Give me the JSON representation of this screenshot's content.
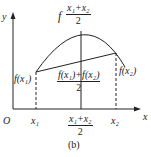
{
  "figure": {
    "caption": "(b)",
    "axes": {
      "x_label": "x",
      "y_label": "y",
      "origin_label": "O"
    },
    "x_ticks": {
      "x1": "x₁",
      "x2": "x₂",
      "mid_num": "x₁+x₂",
      "mid_den": "2"
    },
    "points": {
      "f_x1": "f(x₁)",
      "f_x2": "f(x₂)",
      "top_prefix": "f",
      "top_num": "x₁+x₂",
      "top_den": "2",
      "avg_num": "f(x₁)+f(x₂)",
      "avg_den": "2"
    }
  }
}
